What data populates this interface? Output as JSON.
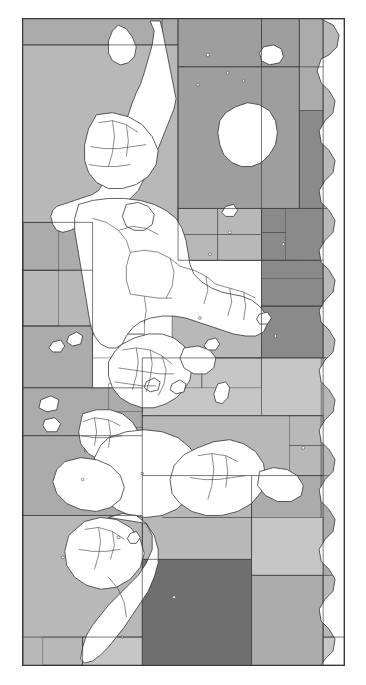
{
  "document": {
    "kind": "figure-only page",
    "figure_caption": "",
    "page_background": "#ffffff"
  },
  "figure": {
    "name": "world-map-maritime-zones",
    "title": "",
    "orientation_note": "world map rotated 90 degrees counter-clockwise",
    "frame": {
      "x": 22,
      "y": 18,
      "width": 323,
      "height": 648,
      "border_color": "#3a3a3a",
      "border_width": 1,
      "background": "#ffffff"
    },
    "legend": {
      "present": false,
      "entries": []
    },
    "axes": {
      "present": false,
      "tick_labels": []
    },
    "labels": [],
    "palette": {
      "land_fill": "#ffffff",
      "land_stroke": "#2b2b2b",
      "cell_stroke": "#4a4a4a",
      "grey_1_lightest": "#e2e2e2",
      "grey_2": "#d2d2d2",
      "grey_3": "#c6c6c6",
      "grey_4_mid": "#b8b8b8",
      "grey_5": "#ababab",
      "grey_6": "#9e9e9e",
      "grey_7_dark": "#8a8a8a",
      "grey_8_darkest": "#6f6f6f"
    }
  },
  "chart_data": {
    "type": "map",
    "title": "",
    "xlabel": "",
    "ylabel": "",
    "projection": "equirectangular, rotated 90° CCW",
    "shading_variable": "maritime zone shade class",
    "shade_classes": [
      {
        "id": 1,
        "color": "#e2e2e2",
        "label": "lightest"
      },
      {
        "id": 2,
        "color": "#d2d2d2",
        "label": "light"
      },
      {
        "id": 3,
        "color": "#c6c6c6",
        "label": "light-mid"
      },
      {
        "id": 4,
        "color": "#b8b8b8",
        "label": "mid"
      },
      {
        "id": 5,
        "color": "#ababab",
        "label": "mid-dark"
      },
      {
        "id": 6,
        "color": "#9e9e9e",
        "label": "dark-mid"
      },
      {
        "id": 7,
        "color": "#8a8a8a",
        "label": "dark"
      },
      {
        "id": 8,
        "color": "#6f6f6f",
        "label": "darkest"
      }
    ],
    "ocean_cells": [
      {
        "x": 0,
        "y": 0,
        "w": 140,
        "h": 26,
        "shade": 5
      },
      {
        "x": 140,
        "y": 0,
        "w": 16,
        "h": 26,
        "shade": 5
      },
      {
        "x": 0,
        "y": 26,
        "w": 156,
        "h": 178,
        "shade": 4
      },
      {
        "x": 156,
        "y": 0,
        "w": 84,
        "h": 48,
        "shade": 6
      },
      {
        "x": 240,
        "y": 0,
        "w": 38,
        "h": 48,
        "shade": 6
      },
      {
        "x": 156,
        "y": 48,
        "w": 122,
        "h": 142,
        "shade": 6
      },
      {
        "x": 278,
        "y": 0,
        "w": 24,
        "h": 92,
        "shade": 5
      },
      {
        "x": 278,
        "y": 92,
        "w": 24,
        "h": 98,
        "shade": 7
      },
      {
        "x": 302,
        "y": 0,
        "w": 21,
        "h": 190,
        "shade": 4
      },
      {
        "x": 156,
        "y": 190,
        "w": 122,
        "h": 52,
        "shade": 4
      },
      {
        "x": 0,
        "y": 204,
        "w": 70,
        "h": 48,
        "shade": 5
      },
      {
        "x": 0,
        "y": 252,
        "w": 70,
        "h": 56,
        "shade": 4
      },
      {
        "x": 0,
        "y": 308,
        "w": 70,
        "h": 62,
        "shade": 5
      },
      {
        "x": 240,
        "y": 190,
        "w": 62,
        "h": 52,
        "shade": 7
      },
      {
        "x": 240,
        "y": 242,
        "w": 62,
        "h": 46,
        "shade": 7
      },
      {
        "x": 240,
        "y": 288,
        "w": 62,
        "h": 52,
        "shade": 7
      },
      {
        "x": 302,
        "y": 190,
        "w": 21,
        "h": 150,
        "shade": 4
      },
      {
        "x": 150,
        "y": 290,
        "w": 90,
        "h": 50,
        "shade": 4
      },
      {
        "x": 0,
        "y": 370,
        "w": 120,
        "h": 48,
        "shade": 5
      },
      {
        "x": 120,
        "y": 340,
        "w": 120,
        "h": 58,
        "shade": 3
      },
      {
        "x": 240,
        "y": 340,
        "w": 62,
        "h": 58,
        "shade": 3
      },
      {
        "x": 120,
        "y": 398,
        "w": 180,
        "h": 60,
        "shade": 4
      },
      {
        "x": 300,
        "y": 340,
        "w": 23,
        "h": 120,
        "shade": 4
      },
      {
        "x": 0,
        "y": 418,
        "w": 120,
        "h": 80,
        "shade": 5
      },
      {
        "x": 120,
        "y": 458,
        "w": 110,
        "h": 84,
        "shade": 4
      },
      {
        "x": 230,
        "y": 458,
        "w": 70,
        "h": 84,
        "shade": 5
      },
      {
        "x": 300,
        "y": 458,
        "w": 23,
        "h": 100,
        "shade": 5
      },
      {
        "x": 0,
        "y": 498,
        "w": 120,
        "h": 150,
        "shade": 4
      },
      {
        "x": 120,
        "y": 542,
        "w": 110,
        "h": 106,
        "shade": 8
      },
      {
        "x": 230,
        "y": 500,
        "w": 72,
        "h": 58,
        "shade": 3
      },
      {
        "x": 230,
        "y": 558,
        "w": 72,
        "h": 90,
        "shade": 5
      },
      {
        "x": 302,
        "y": 558,
        "w": 21,
        "h": 90,
        "shade": 4
      },
      {
        "x": 60,
        "y": 620,
        "w": 60,
        "h": 28,
        "shade": 3
      },
      {
        "x": 120,
        "y": 648,
        "w": 0,
        "h": 0,
        "shade": 4
      }
    ],
    "landmass_groups": [
      {
        "name": "north-america",
        "fill": "#ffffff"
      },
      {
        "name": "greenland",
        "fill": "#ffffff"
      },
      {
        "name": "south-america",
        "fill": "#ffffff"
      },
      {
        "name": "eurasia",
        "fill": "#ffffff"
      },
      {
        "name": "africa",
        "fill": "#ffffff"
      },
      {
        "name": "australia",
        "fill": "#ffffff"
      },
      {
        "name": "antarctica-fringe",
        "fill": "#ffffff"
      },
      {
        "name": "island-arcs",
        "fill": "#ffffff"
      }
    ]
  }
}
